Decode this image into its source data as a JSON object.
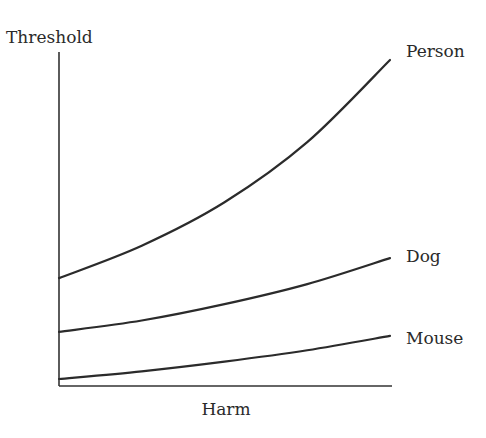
{
  "chart_data": {
    "type": "line",
    "title": "",
    "xlabel": "Harm",
    "ylabel": "Threshold",
    "xlim": [
      0,
      1
    ],
    "ylim": [
      0,
      1
    ],
    "grid": false,
    "ticks": "none",
    "legend": "inline labels at right end of each curve",
    "x": [
      0,
      0.25,
      0.5,
      0.75,
      1.0
    ],
    "series": [
      {
        "name": "Person",
        "values": [
          0.323,
          0.42,
          0.55,
          0.73,
          0.976
        ]
      },
      {
        "name": "Dog",
        "values": [
          0.162,
          0.196,
          0.245,
          0.305,
          0.383
        ]
      },
      {
        "name": "Mouse",
        "values": [
          0.021,
          0.044,
          0.073,
          0.107,
          0.15
        ]
      }
    ]
  }
}
